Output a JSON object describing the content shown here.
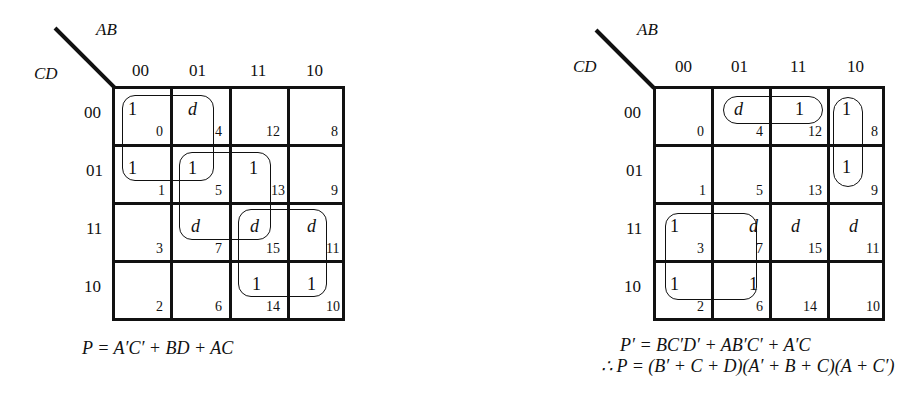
{
  "left_map": {
    "row_var": "CD",
    "col_var": "AB",
    "col_labels": [
      "00",
      "01",
      "11",
      "10"
    ],
    "row_labels": [
      "00",
      "01",
      "11",
      "10"
    ],
    "cells": [
      [
        {
          "v": "1",
          "i": "0"
        },
        {
          "v": "d",
          "i": "4"
        },
        {
          "v": "",
          "i": "12"
        },
        {
          "v": "",
          "i": "8"
        }
      ],
      [
        {
          "v": "1",
          "i": "1"
        },
        {
          "v": "1",
          "i": "5"
        },
        {
          "v": "1",
          "i": "13"
        },
        {
          "v": "",
          "i": "9"
        }
      ],
      [
        {
          "v": "",
          "i": "3"
        },
        {
          "v": "d",
          "i": "7"
        },
        {
          "v": "d",
          "i": "15"
        },
        {
          "v": "d",
          "i": "11"
        }
      ],
      [
        {
          "v": "",
          "i": "2"
        },
        {
          "v": "",
          "i": "6"
        },
        {
          "v": "1",
          "i": "14"
        },
        {
          "v": "1",
          "i": "10"
        }
      ]
    ],
    "groups": [
      "A'C' (cells 0,1,4,5)",
      "BD (cells 5,7,13,15)",
      "AC (cells 10,11,14,15)"
    ],
    "equation": "P = A′C′ + BD + AC"
  },
  "right_map": {
    "row_var": "CD",
    "col_var": "AB",
    "col_labels": [
      "00",
      "01",
      "11",
      "10"
    ],
    "row_labels": [
      "00",
      "01",
      "11",
      "10"
    ],
    "cells": [
      [
        {
          "v": "",
          "i": "0"
        },
        {
          "v": "d",
          "i": "4"
        },
        {
          "v": "1",
          "i": "12"
        },
        {
          "v": "1",
          "i": "8"
        }
      ],
      [
        {
          "v": "",
          "i": "1"
        },
        {
          "v": "",
          "i": "5"
        },
        {
          "v": "",
          "i": "13"
        },
        {
          "v": "1",
          "i": "9"
        }
      ],
      [
        {
          "v": "1",
          "i": "3"
        },
        {
          "v": "d",
          "i": "7"
        },
        {
          "v": "d",
          "i": "15"
        },
        {
          "v": "d",
          "i": "11"
        }
      ],
      [
        {
          "v": "1",
          "i": "2"
        },
        {
          "v": "1",
          "i": "6"
        },
        {
          "v": "",
          "i": "14"
        },
        {
          "v": "",
          "i": "10"
        }
      ]
    ],
    "groups": [
      "BC'D' (cells 4,12)",
      "AB'C' (cells 8,9)",
      "A'C (cells 2,3,6,7)"
    ],
    "equation_1": "P′ = BC′D′ + AB′C′ + A′C",
    "equation_2": "∴ P = (B′ + C + D)(A′ + B + C)(A + C′)"
  }
}
